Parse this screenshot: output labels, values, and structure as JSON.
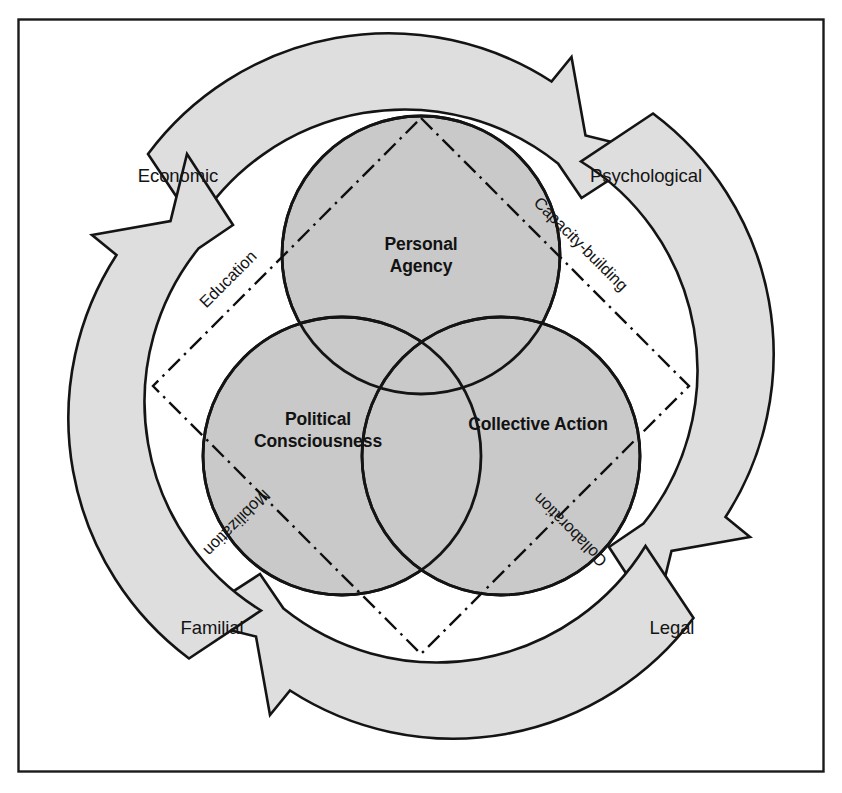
{
  "figure": {
    "kind": "venn-cycle-diagram",
    "frame": {
      "border_color": "#1a1a1a",
      "background": "#ffffff"
    }
  },
  "colors": {
    "circle_fill": "#c9c9c9",
    "circle_stroke": "#141414",
    "arrow_fill": "#dedede",
    "arrow_stroke": "#141414",
    "dash_line": "#0f0f0f",
    "text": "#141414"
  },
  "venn": {
    "circles": [
      {
        "id": "personal-agency",
        "label_line1": "Personal",
        "label_line2": "Agency",
        "cx": 421,
        "cy": 255,
        "r": 139
      },
      {
        "id": "political-consciousness",
        "label_line1": "Political",
        "label_line2": "Consciousness",
        "cx": 342,
        "cy": 456,
        "r": 139
      },
      {
        "id": "collective-action",
        "label_line1": "Collective Action",
        "label_line2": "",
        "cx": 501,
        "cy": 456,
        "r": 139
      }
    ]
  },
  "diamond": {
    "center_x": 421,
    "center_y": 386,
    "half_diagonal": 268,
    "edge_labels": [
      {
        "id": "education",
        "text": "Education",
        "corner": "top-left"
      },
      {
        "id": "capacity-building",
        "text": "Capacity-building",
        "corner": "top-right"
      },
      {
        "id": "mobilization",
        "text": "Mobilization",
        "corner": "bottom-left"
      },
      {
        "id": "collaboration",
        "text": "Collaboration",
        "corner": "bottom-right"
      }
    ]
  },
  "outer_labels": [
    {
      "id": "economic",
      "text": "Economic",
      "position": "top-left",
      "x": 178,
      "y": 182
    },
    {
      "id": "psychological",
      "text": "Psychological",
      "position": "top-right",
      "x": 646,
      "y": 182
    },
    {
      "id": "familial",
      "text": "Familial",
      "position": "bottom-left",
      "x": 212,
      "y": 634
    },
    {
      "id": "legal",
      "text": "Legal",
      "position": "bottom-right",
      "x": 672,
      "y": 634
    }
  ],
  "cycle_arrows": [
    {
      "id": "arrow-top",
      "direction": "clockwise-rightward",
      "points_to": "psychological"
    },
    {
      "id": "arrow-right",
      "direction": "clockwise-downward",
      "points_to": "legal"
    },
    {
      "id": "arrow-bottom",
      "direction": "clockwise-leftward",
      "points_to": "familial"
    },
    {
      "id": "arrow-left",
      "direction": "clockwise-upward",
      "points_to": "economic"
    }
  ]
}
